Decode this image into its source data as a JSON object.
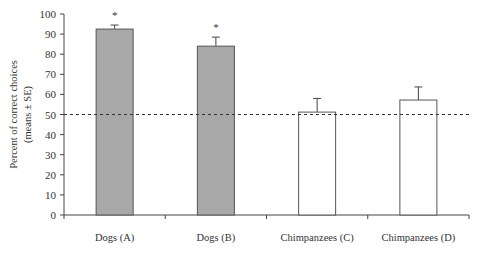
{
  "chart_data": {
    "type": "bar",
    "title": "",
    "xlabel": "",
    "ylabel": "Percent of correct choices",
    "ylabel_line2": "(means ± SE)",
    "ylim": [
      0,
      100
    ],
    "yticks": [
      0,
      10,
      20,
      30,
      40,
      50,
      60,
      70,
      80,
      90,
      100
    ],
    "categories": [
      "Dogs (A)",
      "Dogs (B)",
      "Chimpanzees (C)",
      "Chimpanzees (D)"
    ],
    "values": [
      92.5,
      84,
      51.2,
      57.2
    ],
    "errors": [
      2,
      4.5,
      6.8,
      6.5
    ],
    "significance": [
      "*",
      "*",
      "",
      ""
    ],
    "bar_fill": [
      "#a8a8a8",
      "#a8a8a8",
      "#ffffff",
      "#ffffff"
    ],
    "reference_line": {
      "y": 50,
      "style": "dashed",
      "label": "chance"
    },
    "grid": false,
    "legend": null
  }
}
